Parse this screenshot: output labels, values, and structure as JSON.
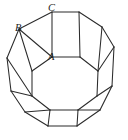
{
  "figure": {
    "background_color": "#ffffff",
    "stroke_color": "#2b2b2b",
    "face_fill_color": "#ffffff",
    "stroke_width": 1.05,
    "labels": [
      {
        "id": "label-A",
        "text": "A",
        "x": 48,
        "y": 52,
        "anchor_vertex": "inner-octagon-top-left",
        "style": "italic"
      },
      {
        "id": "label-B",
        "text": "B",
        "x": 15,
        "y": 23,
        "anchor_vertex": "outer-upper-left",
        "style": "italic"
      },
      {
        "id": "label-C",
        "text": "C",
        "x": 48,
        "y": 3,
        "anchor_vertex": "top-square-upper-left",
        "style": "italic"
      }
    ],
    "outer_boundary": {
      "name": "outer-decagon",
      "points": "52,12 79,12 102,27 114,47 112,86 100,110 77,126 48,126 25,112 11,91 7,58 19,29"
    },
    "inner_face": {
      "name": "inner-octagon",
      "points": "52,57 80,57 98,71 97,96 78,110 50,110 32,96 32,71"
    },
    "faces": [
      {
        "name": "face-top-square",
        "points": "52,12 79,12 80,57 52,57"
      },
      {
        "name": "face-bottom-square",
        "points": "50,110 78,110 77,126 48,126"
      },
      {
        "name": "face-upper-right-square",
        "points": "79,12 102,27 98,71 80,57"
      },
      {
        "name": "face-right-square",
        "points": "114,47 112,86 97,96 98,71"
      },
      {
        "name": "face-lower-right-square",
        "points": "112,86 100,110 78,110 97,96"
      },
      {
        "name": "face-upper-left-square",
        "points": "19,29 52,12 52,57 32,71"
      },
      {
        "name": "face-left-square",
        "points": "7,58 19,29 32,71 32,96"
      },
      {
        "name": "face-lower-left-square",
        "points": "11,91 32,96 50,110 25,112"
      },
      {
        "name": "face-triangle-upper-left",
        "points": "19,29 52,12 32,71"
      },
      {
        "name": "face-triangle-left",
        "points": "7,58 11,91 32,96"
      },
      {
        "name": "face-triangle-lower-left",
        "points": "25,112 48,126 50,110"
      },
      {
        "name": "face-triangle-upper-right",
        "points": "102,27 114,47 98,71"
      },
      {
        "name": "face-triangle-lower-right",
        "points": "100,110 77,126 78,110"
      }
    ],
    "edges": [
      {
        "name": "edge-outer-top",
        "x1": 52,
        "y1": 12,
        "x2": 79,
        "y2": 12
      },
      {
        "name": "edge-outer-upper-right",
        "x1": 79,
        "y1": 12,
        "x2": 102,
        "y2": 27
      },
      {
        "name": "edge-outer-right-upper",
        "x1": 102,
        "y1": 27,
        "x2": 114,
        "y2": 47
      },
      {
        "name": "edge-outer-right",
        "x1": 114,
        "y1": 47,
        "x2": 112,
        "y2": 86
      },
      {
        "name": "edge-outer-lower-right",
        "x1": 112,
        "y1": 86,
        "x2": 100,
        "y2": 110
      },
      {
        "name": "edge-outer-bottom-right",
        "x1": 100,
        "y1": 110,
        "x2": 77,
        "y2": 126
      },
      {
        "name": "edge-outer-bottom",
        "x1": 77,
        "y1": 126,
        "x2": 48,
        "y2": 126
      },
      {
        "name": "edge-outer-bottom-left",
        "x1": 48,
        "y1": 126,
        "x2": 25,
        "y2": 112
      },
      {
        "name": "edge-outer-lower-left",
        "x1": 25,
        "y1": 112,
        "x2": 11,
        "y2": 91
      },
      {
        "name": "edge-outer-left",
        "x1": 11,
        "y1": 91,
        "x2": 7,
        "y2": 58
      },
      {
        "name": "edge-outer-left-upper",
        "x1": 7,
        "y1": 58,
        "x2": 19,
        "y2": 29
      },
      {
        "name": "edge-outer-upper-left",
        "x1": 19,
        "y1": 29,
        "x2": 52,
        "y2": 12
      },
      {
        "name": "edge-inner-top",
        "x1": 52,
        "y1": 57,
        "x2": 80,
        "y2": 57
      },
      {
        "name": "edge-inner-upper-right",
        "x1": 80,
        "y1": 57,
        "x2": 98,
        "y2": 71
      },
      {
        "name": "edge-inner-right",
        "x1": 98,
        "y1": 71,
        "x2": 97,
        "y2": 96
      },
      {
        "name": "edge-inner-lower-right",
        "x1": 97,
        "y1": 96,
        "x2": 78,
        "y2": 110
      },
      {
        "name": "edge-inner-bottom",
        "x1": 78,
        "y1": 110,
        "x2": 50,
        "y2": 110
      },
      {
        "name": "edge-inner-lower-left",
        "x1": 50,
        "y1": 110,
        "x2": 32,
        "y2": 96
      },
      {
        "name": "edge-inner-left",
        "x1": 32,
        "y1": 96,
        "x2": 32,
        "y2": 71
      },
      {
        "name": "edge-inner-upper-left",
        "x1": 32,
        "y1": 71,
        "x2": 52,
        "y2": 57
      },
      {
        "name": "edge-spoke-top-left",
        "x1": 52,
        "y1": 12,
        "x2": 52,
        "y2": 57
      },
      {
        "name": "edge-spoke-top-right",
        "x1": 79,
        "y1": 12,
        "x2": 80,
        "y2": 57
      },
      {
        "name": "edge-spoke-upper-right",
        "x1": 102,
        "y1": 27,
        "x2": 98,
        "y2": 71
      },
      {
        "name": "edge-spoke-right-upper",
        "x1": 114,
        "y1": 47,
        "x2": 98,
        "y2": 71
      },
      {
        "name": "edge-spoke-right-lower",
        "x1": 112,
        "y1": 86,
        "x2": 97,
        "y2": 96
      },
      {
        "name": "edge-spoke-lower-right",
        "x1": 100,
        "y1": 110,
        "x2": 78,
        "y2": 110
      },
      {
        "name": "edge-spoke-bottom-right",
        "x1": 77,
        "y1": 126,
        "x2": 78,
        "y2": 110
      },
      {
        "name": "edge-spoke-bottom-left",
        "x1": 48,
        "y1": 126,
        "x2": 50,
        "y2": 110
      },
      {
        "name": "edge-spoke-lower-left",
        "x1": 25,
        "y1": 112,
        "x2": 50,
        "y2": 110
      },
      {
        "name": "edge-spoke-left-lower",
        "x1": 11,
        "y1": 91,
        "x2": 32,
        "y2": 96
      },
      {
        "name": "edge-spoke-left-upper",
        "x1": 7,
        "y1": 58,
        "x2": 32,
        "y2": 96
      },
      {
        "name": "edge-spoke-upper-left-a",
        "x1": 19,
        "y1": 29,
        "x2": 32,
        "y2": 71
      },
      {
        "name": "edge-spoke-upper-left-b",
        "x1": 19,
        "y1": 29,
        "x2": 52,
        "y2": 57
      }
    ]
  }
}
